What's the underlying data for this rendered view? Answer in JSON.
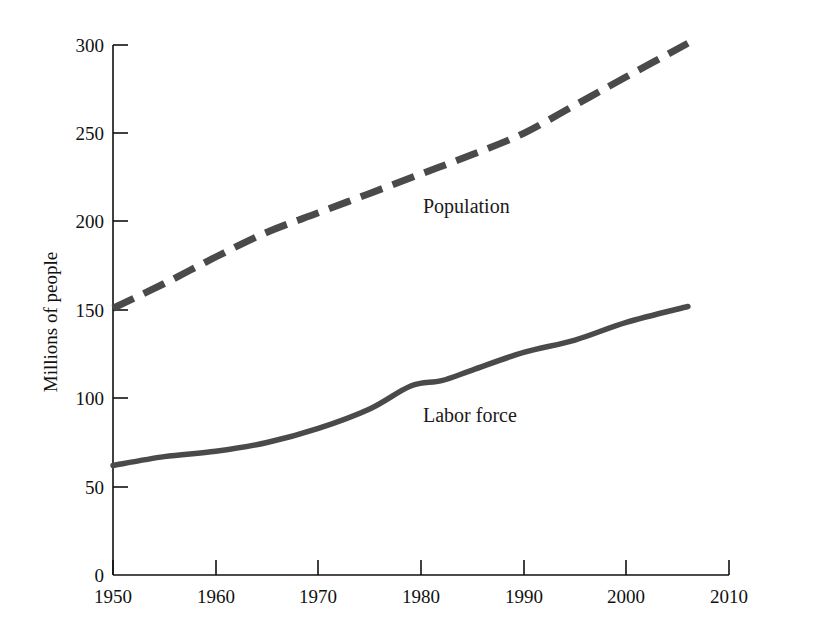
{
  "chart_data": {
    "type": "line",
    "title": "",
    "xlabel": "",
    "ylabel": "Millions of people",
    "xlim": [
      1950,
      2010
    ],
    "ylim": [
      0,
      300
    ],
    "xticks": [
      1950,
      1960,
      1970,
      1980,
      1990,
      2000,
      2010
    ],
    "xtick_labels": [
      "1950",
      "1960",
      "1970",
      "1980",
      "1990",
      "2000",
      "2010"
    ],
    "yticks": [
      0,
      50,
      100,
      150,
      200,
      250,
      300
    ],
    "ytick_labels": [
      "0",
      "50",
      "100",
      "150",
      "200",
      "250",
      "300"
    ],
    "grid": false,
    "legend_position": "inline-annotations",
    "line_color": "#4a4a4a",
    "axis_color": "#111111",
    "background": "#ffffff",
    "series": [
      {
        "name": "Population",
        "style": "dashed",
        "color": "#4a4a4a",
        "label_annotation": "Population",
        "x": [
          1950,
          1955,
          1960,
          1965,
          1970,
          1975,
          1980,
          1985,
          1990,
          1995,
          2000,
          2006
        ],
        "values": [
          151,
          165,
          180,
          194,
          205,
          216,
          227,
          238,
          250,
          266,
          282,
          301
        ]
      },
      {
        "name": "Labor force",
        "style": "solid",
        "color": "#4a4a4a",
        "label_annotation": "Labor force",
        "x": [
          1950,
          1955,
          1960,
          1965,
          1970,
          1975,
          1979,
          1982,
          1985,
          1990,
          1995,
          2000,
          2006
        ],
        "values": [
          62,
          67,
          70,
          75,
          83,
          94,
          107,
          110,
          116,
          126,
          133,
          143,
          152
        ]
      }
    ],
    "annotations": [
      {
        "text": "Population",
        "x_px": 423,
        "y_px": 213
      },
      {
        "text": "Labor force",
        "x_px": 423,
        "y_px": 422
      }
    ]
  }
}
